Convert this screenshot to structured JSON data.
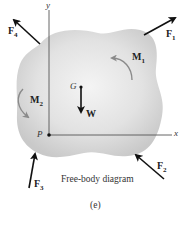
{
  "diagram": {
    "caption": "Free-body diagram",
    "sublabel": "(e)",
    "axes": {
      "x_label": "x",
      "y_label": "y"
    },
    "points": {
      "origin": "P",
      "center_of_gravity": "G"
    },
    "forces": [
      {
        "id": "F1",
        "base": "F",
        "sub": "1"
      },
      {
        "id": "F2",
        "base": "F",
        "sub": "2"
      },
      {
        "id": "F3",
        "base": "F",
        "sub": "3"
      },
      {
        "id": "F4",
        "base": "F",
        "sub": "4"
      }
    ],
    "weight": {
      "label": "W"
    },
    "moments": [
      {
        "id": "M1",
        "base": "M",
        "sub": "1"
      },
      {
        "id": "M2",
        "base": "M",
        "sub": "2"
      }
    ],
    "colors": {
      "body_fill": "#d9d9d9",
      "body_center": "#f2f2f2",
      "axis": "#555555",
      "force_arrow": "#111111",
      "moment_arrow": "#8a8a8a"
    }
  }
}
